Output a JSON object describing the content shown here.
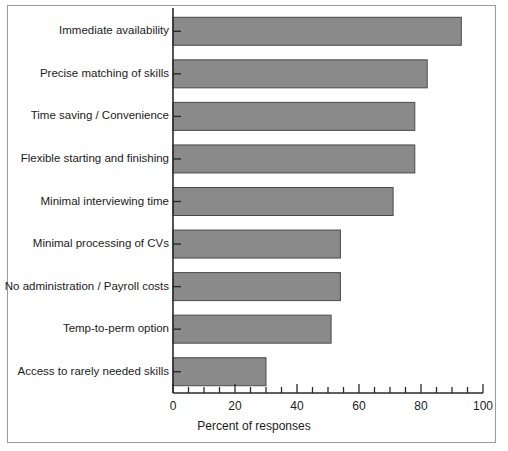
{
  "figure": {
    "background_color": "#ffffff",
    "frame_color": "#9a9a9a",
    "bar_fill_color": "#8a8a8a",
    "bar_edge_color": "#4a4a4a",
    "axis_color": "#2a2a2a",
    "text_color": "#1b1b1b"
  },
  "chart_data": {
    "type": "bar",
    "orientation": "horizontal",
    "title": "",
    "xlabel": "Percent of responses",
    "ylabel": "",
    "xlim": [
      0,
      100
    ],
    "xticks": [
      0,
      20,
      40,
      60,
      80,
      100
    ],
    "xtick_labels": [
      "0",
      "20",
      "40",
      "60",
      "80",
      "100"
    ],
    "minor_tick_interval": 5,
    "grid": false,
    "legend": false,
    "categories": [
      "Immediate availability",
      "Precise matching of skills",
      "Time saving / Convenience",
      "Flexible starting and finishing",
      "Minimal interviewing time",
      "Minimal processing of CVs",
      "No administration / Payroll costs",
      "Temp-to-perm option",
      "Access to rarely needed skills"
    ],
    "values": [
      93,
      82,
      78,
      78,
      71,
      54,
      54,
      51,
      30
    ]
  }
}
